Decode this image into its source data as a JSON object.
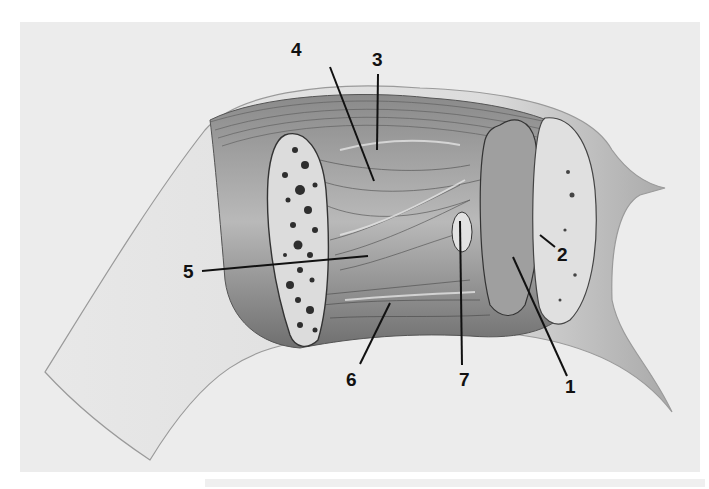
{
  "figure": {
    "type": "anatomical illustration",
    "style": "grayscale pencil drawing",
    "background_color": "#ececec",
    "labels": [
      {
        "id": "1",
        "text": "1",
        "x": 565,
        "y": 377
      },
      {
        "id": "2",
        "text": "2",
        "x": 557,
        "y": 245
      },
      {
        "id": "3",
        "text": "3",
        "x": 372,
        "y": 50
      },
      {
        "id": "4",
        "text": "4",
        "x": 291,
        "y": 40
      },
      {
        "id": "5",
        "text": "5",
        "x": 183,
        "y": 262
      },
      {
        "id": "6",
        "text": "6",
        "x": 346,
        "y": 370
      },
      {
        "id": "7",
        "text": "7",
        "x": 459,
        "y": 370
      }
    ]
  }
}
